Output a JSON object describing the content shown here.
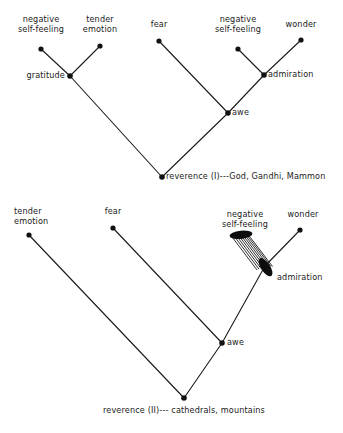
{
  "figure": {
    "type": "hierarchical-tree-diagram",
    "background_color": "#ffffff",
    "ink_color": "#1a1a1a",
    "diagrams": [
      {
        "id": "reverence-i",
        "root_label": "reverence (I)---God, Gandhi, Mammon",
        "nodes": [
          {
            "id": "neg-self-feeling-left",
            "label": "negative\nself-feeling",
            "x": 41,
            "y": 49,
            "shape": "dot",
            "label_x": 41,
            "label_y": 16,
            "align": "center"
          },
          {
            "id": "tender-emotion",
            "label": "tender\nemotion",
            "x": 100,
            "y": 46,
            "shape": "dot",
            "label_x": 100,
            "label_y": 16,
            "align": "center"
          },
          {
            "id": "fear",
            "label": "fear",
            "x": 159,
            "y": 41,
            "shape": "dot",
            "label_x": 159,
            "label_y": 21,
            "align": "center"
          },
          {
            "id": "neg-self-feeling-right",
            "label": "negative\nself-feeling",
            "x": 238,
            "y": 49,
            "shape": "dot",
            "label_x": 238,
            "label_y": 16,
            "align": "center"
          },
          {
            "id": "wonder",
            "label": "wonder",
            "x": 301,
            "y": 40,
            "shape": "dot",
            "label_x": 301,
            "label_y": 21,
            "align": "center"
          },
          {
            "id": "gratitude",
            "label": "gratitude",
            "x": 70,
            "y": 76,
            "shape": "dot",
            "label_x": 65,
            "label_y": 71,
            "align": "right"
          },
          {
            "id": "admiration",
            "label": "admiration",
            "x": 264,
            "y": 75,
            "shape": "dot",
            "label_x": 269,
            "label_y": 70,
            "align": "left"
          },
          {
            "id": "awe",
            "label": "awe",
            "x": 228,
            "y": 113,
            "shape": "dot",
            "label_x": 232,
            "label_y": 113,
            "align": "left"
          },
          {
            "id": "reverence-root",
            "label": "reverence (I)---God, Gandhi, Mammon",
            "x": 162,
            "y": 177,
            "shape": "dot",
            "label_x": 166,
            "label_y": 172,
            "align": "left"
          }
        ],
        "edges": [
          {
            "from": "neg-self-feeling-left",
            "to": "gratitude",
            "style": "plain"
          },
          {
            "from": "tender-emotion",
            "to": "gratitude",
            "style": "plain"
          },
          {
            "from": "gratitude",
            "to": "reverence-root",
            "style": "plain"
          },
          {
            "from": "fear",
            "to": "awe",
            "style": "plain"
          },
          {
            "from": "neg-self-feeling-right",
            "to": "admiration",
            "style": "plain"
          },
          {
            "from": "wonder",
            "to": "admiration",
            "style": "plain"
          },
          {
            "from": "admiration",
            "to": "awe",
            "style": "plain"
          },
          {
            "from": "awe",
            "to": "reverence-root",
            "style": "plain"
          }
        ]
      },
      {
        "id": "reverence-ii",
        "root_label": "reverence (II)--- cathedrals, mountains",
        "nodes": [
          {
            "id": "tender-emotion-2",
            "label": "tender\nemotion",
            "x": 29,
            "y": 235,
            "shape": "dot",
            "label_x": 14,
            "label_y": 208,
            "align": "left"
          },
          {
            "id": "fear-2",
            "label": "fear",
            "x": 113,
            "y": 228,
            "shape": "dot",
            "label_x": 113,
            "label_y": 208,
            "align": "center"
          },
          {
            "id": "neg-self-feeling-2",
            "label": "negative\nself-feeling",
            "x": 241,
            "y": 235,
            "shape": "ellipse",
            "label_x": 245,
            "label_y": 211,
            "align": "center"
          },
          {
            "id": "wonder-2",
            "label": "wonder",
            "x": 300,
            "y": 230,
            "shape": "dot",
            "label_x": 302,
            "label_y": 211,
            "align": "center"
          },
          {
            "id": "admiration-2",
            "label": "admiration",
            "x": 265,
            "y": 266,
            "shape": "ellipse",
            "label_x": 276,
            "label_y": 273,
            "align": "left"
          },
          {
            "id": "awe-2",
            "label": "awe",
            "x": 222,
            "y": 343,
            "shape": "dot",
            "label_x": 227,
            "label_y": 342,
            "align": "left"
          },
          {
            "id": "reverence-root-2",
            "label": "reverence (II)--- cathedrals, mountains",
            "x": 184,
            "y": 398,
            "shape": "dot",
            "label_x": 184,
            "label_y": 405,
            "align": "center"
          }
        ],
        "edges": [
          {
            "from": "tender-emotion-2",
            "to": "reverence-root-2",
            "style": "plain"
          },
          {
            "from": "fear-2",
            "to": "awe-2",
            "style": "plain"
          },
          {
            "from": "neg-self-feeling-2",
            "to": "admiration-2",
            "style": "hatched-ribbon",
            "line_count": 9
          },
          {
            "from": "wonder-2",
            "to": "admiration-2",
            "style": "plain"
          },
          {
            "from": "admiration-2",
            "to": "awe-2",
            "style": "plain"
          },
          {
            "from": "awe-2",
            "to": "reverence-root-2",
            "style": "plain"
          }
        ]
      }
    ]
  }
}
